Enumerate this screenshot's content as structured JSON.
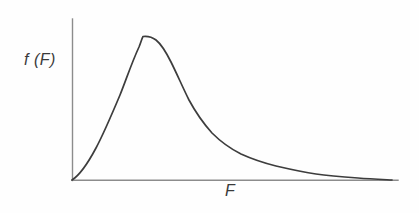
{
  "figure": {
    "background_color": "#fefefe",
    "axis_color": "#8c8c8c",
    "curve_color": "#3d3d3d",
    "label_color": "#3a3a3a"
  },
  "labels": {
    "y_axis": "f (F)",
    "x_axis": "F"
  },
  "chart_data": {
    "type": "line",
    "title": "",
    "subtitle": "",
    "xlabel": "F",
    "ylabel": "f (F)",
    "legend": [],
    "grid": false,
    "axis_style": "two-axis-corner-no-ticks",
    "xlim": [
      0,
      1
    ],
    "ylim": [
      0,
      1
    ],
    "axes_pixels": {
      "origin": [
        72,
        180
      ],
      "y_axis_top": [
        72,
        19
      ],
      "x_axis_right": [
        398,
        180
      ]
    },
    "peak": {
      "x_norm": 0.205,
      "y_norm": 1.0,
      "pixel": [
        139,
        36
      ]
    },
    "x": [
      0.0,
      0.02,
      0.05,
      0.08,
      0.11,
      0.14,
      0.17,
      0.2,
      0.205,
      0.23,
      0.26,
      0.3,
      0.34,
      0.38,
      0.42,
      0.46,
      0.5,
      0.55,
      0.6,
      0.65,
      0.7,
      0.75,
      0.8,
      0.85,
      0.9,
      0.95,
      1.0
    ],
    "y": [
      0.0,
      0.12,
      0.33,
      0.54,
      0.73,
      0.88,
      0.97,
      1.0,
      1.0,
      0.97,
      0.9,
      0.77,
      0.63,
      0.51,
      0.41,
      0.33,
      0.27,
      0.21,
      0.16,
      0.125,
      0.095,
      0.072,
      0.054,
      0.039,
      0.026,
      0.014,
      0.005
    ],
    "curve_path": "M 72 180 C 80 175 88 163 96 148 C 104 133 112 114 120 95 C 126 80 132 62 139 47 C 141 42 142 38 143 36.5 C 147 36 152 37 156 40 C 161 44 166 52 171 62 C 177 74 183 88 189 100 C 196 113 204 124 212 133 C 221 142 231 149 241 154 C 252 159 264 163 276 166 C 289 169 302 172 316 174 C 330 176 344 177 358 178 C 370 179 382 179.5 392 180"
  }
}
